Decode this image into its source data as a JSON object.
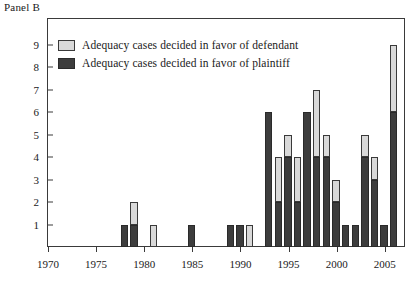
{
  "panel": {
    "title": "Panel B"
  },
  "legend": {
    "position": "top-left-inside",
    "entries": [
      {
        "key": "defendant",
        "label": "Adequacy cases decided in favor of defendant",
        "color": "#d9d9d9"
      },
      {
        "key": "plaintiff",
        "label": "Adequacy cases decided in favor of plaintiff",
        "color": "#3d3d3d"
      }
    ]
  },
  "axes": {
    "y_ticks": [
      1,
      2,
      3,
      4,
      5,
      6,
      7,
      8,
      9
    ],
    "y_tick_labels": [
      "1",
      "2",
      "3",
      "4",
      "5",
      "6",
      "7",
      "8",
      "9"
    ],
    "x_tick_labels": [
      "1970",
      "1975",
      "1980",
      "1985",
      "1990",
      "1995",
      "2000",
      "2005"
    ],
    "x_tick_values": [
      1970,
      1975,
      1980,
      1985,
      1990,
      1995,
      2000,
      2005
    ]
  },
  "chart_data": {
    "type": "bar",
    "title": "Panel B",
    "subtitle": "",
    "xlabel": "",
    "ylabel": "",
    "stacked": true,
    "grid": false,
    "legend_position": "top-left-inside",
    "xlim": [
      1970,
      2007
    ],
    "ylim": [
      0,
      9
    ],
    "categories": [
      "1970",
      "1971",
      "1972",
      "1973",
      "1974",
      "1975",
      "1976",
      "1977",
      "1978",
      "1979",
      "1980",
      "1981",
      "1982",
      "1983",
      "1984",
      "1985",
      "1986",
      "1987",
      "1988",
      "1989",
      "1990",
      "1991",
      "1992",
      "1993",
      "1994",
      "1995",
      "1996",
      "1997",
      "1998",
      "1999",
      "2000",
      "2001",
      "2002",
      "2003",
      "2004",
      "2005",
      "2006"
    ],
    "series": [
      {
        "name": "Adequacy cases decided in favor of plaintiff",
        "color": "#3d3d3d",
        "values": [
          0,
          0,
          0,
          0,
          0,
          0,
          0,
          0,
          1,
          1,
          0,
          0,
          0,
          0,
          0,
          1,
          0,
          0,
          0,
          1,
          1,
          0,
          0,
          6,
          2,
          4,
          2,
          6,
          4,
          4,
          2,
          1,
          1,
          4,
          3,
          1,
          6
        ]
      },
      {
        "name": "Adequacy cases decided in favor of defendant",
        "color": "#d9d9d9",
        "values": [
          0,
          0,
          0,
          0,
          0,
          0,
          0,
          0,
          0,
          1,
          0,
          1,
          0,
          0,
          0,
          0,
          0,
          0,
          0,
          0,
          0,
          1,
          0,
          0,
          2,
          1,
          2,
          0,
          3,
          1,
          1,
          0,
          0,
          1,
          1,
          0,
          3
        ]
      }
    ],
    "totals": [
      0,
      0,
      0,
      0,
      0,
      0,
      0,
      0,
      1,
      2,
      0,
      1,
      0,
      0,
      0,
      1,
      0,
      0,
      0,
      1,
      1,
      1,
      0,
      6,
      4,
      5,
      4,
      6,
      7,
      5,
      3,
      1,
      1,
      5,
      4,
      1,
      9
    ]
  }
}
